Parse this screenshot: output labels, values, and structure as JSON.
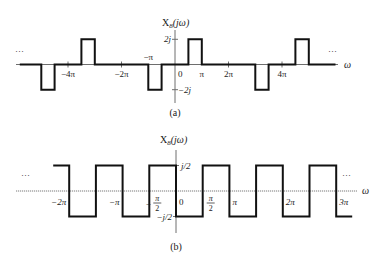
{
  "figure": {
    "panels": [
      {
        "id": "a",
        "caption": "(a)",
        "title_main": "X",
        "title_sub": "8",
        "title_arg": "(jω)",
        "x_axis_label": "ω",
        "ellipsis_left": "···",
        "ellipsis_right": "···",
        "y_ticks": [
          {
            "label": "2j",
            "value": 2
          },
          {
            "label": "−2j",
            "value": -2
          }
        ],
        "x_tick_labels": [
          {
            "label": "−4π",
            "pi": -4
          },
          {
            "label": "−2π",
            "pi": -2
          },
          {
            "label": "−π",
            "pi": -1,
            "above": true
          },
          {
            "label": "0",
            "pi": 0
          },
          {
            "label": "π",
            "pi": 1
          },
          {
            "label": "2π",
            "pi": 2
          },
          {
            "label": "4π",
            "pi": 4
          }
        ]
      },
      {
        "id": "b",
        "caption": "(b)",
        "title_main": "X",
        "title_sub": "8",
        "title_arg": "(jω)",
        "x_axis_label": "ω",
        "ellipsis_left": "···",
        "ellipsis_right": "···",
        "y_ticks": [
          {
            "label": "j/2",
            "value": 0.5
          },
          {
            "label": "−j/2",
            "value": -0.5
          }
        ],
        "x_tick_labels": [
          {
            "label": "−2π",
            "pi": -2
          },
          {
            "label": "−π",
            "pi": -1
          },
          {
            "label": "−π/2",
            "pi": -0.5,
            "fraction": true,
            "sign": "−",
            "num": "π",
            "den": "2"
          },
          {
            "label": "0",
            "pi": 0
          },
          {
            "label": "π/2",
            "pi": 0.5,
            "fraction": true,
            "sign": "",
            "num": "π",
            "den": "2"
          },
          {
            "label": "π",
            "pi": 1
          },
          {
            "label": "2π",
            "pi": 2
          },
          {
            "label": "3π",
            "pi": 3
          }
        ]
      }
    ]
  },
  "chart_data": [
    {
      "type": "line",
      "title": "X8(jω) — (a)",
      "xlabel": "ω",
      "ylabel": "X8(jω)",
      "description": "Imaginary-valued pulses of height ±2j, width π/2, periodic with period 4π",
      "pulses": [
        {
          "from_pi": -5.0,
          "to_pi": -4.5,
          "value": -2
        },
        {
          "from_pi": -3.5,
          "to_pi": -3.0,
          "value": 2
        },
        {
          "from_pi": -1.0,
          "to_pi": -0.5,
          "value": -2
        },
        {
          "from_pi": 0.5,
          "to_pi": 1.0,
          "value": 2
        },
        {
          "from_pi": 3.0,
          "to_pi": 3.5,
          "value": -2
        },
        {
          "from_pi": 4.5,
          "to_pi": 5.0,
          "value": 2
        }
      ],
      "x_range_pi": [
        -5.8,
        6.0
      ],
      "ylim": [
        -2,
        2
      ]
    },
    {
      "type": "line",
      "title": "X8(jω) — (b)",
      "xlabel": "ω",
      "ylabel": "X8(jω)",
      "description": "Square wave alternating between j/2 and −j/2 every π/2 (period π)",
      "segments": [
        {
          "from_pi": -2.3,
          "to_pi": -2.0,
          "value": 0.5
        },
        {
          "from_pi": -2.0,
          "to_pi": -1.5,
          "value": -0.5
        },
        {
          "from_pi": -1.5,
          "to_pi": -1.0,
          "value": 0.5
        },
        {
          "from_pi": -1.0,
          "to_pi": -0.5,
          "value": -0.5
        },
        {
          "from_pi": -0.5,
          "to_pi": 0.0,
          "value": 0.5
        },
        {
          "from_pi": 0.0,
          "to_pi": 0.5,
          "value": -0.5
        },
        {
          "from_pi": 0.5,
          "to_pi": 1.0,
          "value": 0.5
        },
        {
          "from_pi": 1.0,
          "to_pi": 1.5,
          "value": -0.5
        },
        {
          "from_pi": 1.5,
          "to_pi": 2.0,
          "value": 0.5
        },
        {
          "from_pi": 2.0,
          "to_pi": 2.5,
          "value": -0.5
        },
        {
          "from_pi": 2.5,
          "to_pi": 3.0,
          "value": 0.5
        },
        {
          "from_pi": 3.0,
          "to_pi": 3.3,
          "value": -0.5
        }
      ],
      "ylim": [
        -0.5,
        0.5
      ]
    }
  ]
}
